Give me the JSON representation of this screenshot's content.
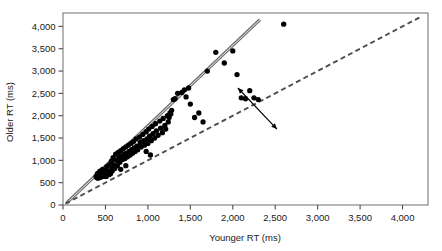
{
  "chart_data": {
    "type": "scatter",
    "title": "",
    "xlabel": "Younger RT (ms)",
    "ylabel": "Older RT (ms)",
    "xlim": [
      0,
      4300
    ],
    "ylim": [
      0,
      4300
    ],
    "grid": false,
    "legend": null,
    "xticks": [
      0,
      500,
      1000,
      1500,
      2000,
      2500,
      3000,
      3500,
      4000
    ],
    "xticklabels": [
      "0",
      "500",
      "1,000",
      "1,500",
      "2,000",
      "2,500",
      "3,000",
      "3,500",
      "4,000"
    ],
    "yticks": [
      0,
      500,
      1000,
      1500,
      2000,
      2500,
      3000,
      3500,
      4000
    ],
    "yticklabels": [
      "0",
      "500",
      "1,000",
      "1,500",
      "2,000",
      "2,500",
      "3,000",
      "3,500",
      "4,000"
    ],
    "marker": "filled-circle",
    "marker_color": "#000000",
    "marker_size": 4.6,
    "points": [
      [
        390,
        640
      ],
      [
        400,
        610
      ],
      [
        405,
        700
      ],
      [
        410,
        660
      ],
      [
        415,
        600
      ],
      [
        420,
        720
      ],
      [
        425,
        680
      ],
      [
        430,
        640
      ],
      [
        435,
        760
      ],
      [
        440,
        700
      ],
      [
        445,
        620
      ],
      [
        450,
        680
      ],
      [
        455,
        730
      ],
      [
        460,
        660
      ],
      [
        465,
        800
      ],
      [
        470,
        700
      ],
      [
        475,
        640
      ],
      [
        480,
        760
      ],
      [
        485,
        690
      ],
      [
        490,
        720
      ],
      [
        495,
        660
      ],
      [
        500,
        700
      ],
      [
        505,
        780
      ],
      [
        510,
        640
      ],
      [
        515,
        860
      ],
      [
        520,
        700
      ],
      [
        525,
        760
      ],
      [
        530,
        720
      ],
      [
        540,
        680
      ],
      [
        545,
        900
      ],
      [
        550,
        760
      ],
      [
        560,
        700
      ],
      [
        570,
        980
      ],
      [
        575,
        820
      ],
      [
        580,
        760
      ],
      [
        590,
        1060
      ],
      [
        600,
        900
      ],
      [
        610,
        820
      ],
      [
        620,
        1140
      ],
      [
        630,
        1000
      ],
      [
        640,
        880
      ],
      [
        650,
        1180
      ],
      [
        660,
        1060
      ],
      [
        670,
        960
      ],
      [
        680,
        1220
      ],
      [
        690,
        1100
      ],
      [
        700,
        1020
      ],
      [
        710,
        1260
      ],
      [
        720,
        1140
      ],
      [
        730,
        1040
      ],
      [
        740,
        1300
      ],
      [
        750,
        1160
      ],
      [
        760,
        1080
      ],
      [
        770,
        1340
      ],
      [
        780,
        1200
      ],
      [
        790,
        1120
      ],
      [
        800,
        1380
      ],
      [
        810,
        1240
      ],
      [
        820,
        1160
      ],
      [
        830,
        1420
      ],
      [
        840,
        1280
      ],
      [
        850,
        1200
      ],
      [
        860,
        1480
      ],
      [
        870,
        1320
      ],
      [
        880,
        1240
      ],
      [
        900,
        1520
      ],
      [
        910,
        1400
      ],
      [
        920,
        1300
      ],
      [
        940,
        1580
      ],
      [
        950,
        1440
      ],
      [
        960,
        1340
      ],
      [
        980,
        1640
      ],
      [
        990,
        1480
      ],
      [
        1000,
        1380
      ],
      [
        1010,
        1700
      ],
      [
        1020,
        1540
      ],
      [
        1040,
        1440
      ],
      [
        1050,
        1760
      ],
      [
        1060,
        1600
      ],
      [
        1080,
        1500
      ],
      [
        1090,
        1820
      ],
      [
        1100,
        1660
      ],
      [
        1120,
        1560
      ],
      [
        1140,
        1880
      ],
      [
        1150,
        1720
      ],
      [
        1170,
        1620
      ],
      [
        1180,
        1940
      ],
      [
        1200,
        1780
      ],
      [
        1210,
        1700
      ],
      [
        1230,
        2000
      ],
      [
        1240,
        1860
      ],
      [
        1250,
        1960
      ],
      [
        1260,
        2060
      ],
      [
        1270,
        2040
      ],
      [
        1280,
        2120
      ],
      [
        1300,
        2360
      ],
      [
        1320,
        2380
      ],
      [
        1350,
        2500
      ],
      [
        1400,
        2520
      ],
      [
        1430,
        2580
      ],
      [
        1450,
        2420
      ],
      [
        1480,
        2620
      ],
      [
        1500,
        2260
      ],
      [
        1550,
        1960
      ],
      [
        1600,
        2060
      ],
      [
        1650,
        1860
      ],
      [
        1700,
        3000
      ],
      [
        1800,
        3420
      ],
      [
        1900,
        3180
      ],
      [
        2000,
        3450
      ],
      [
        2050,
        2920
      ],
      [
        2100,
        2400
      ],
      [
        2150,
        2380
      ],
      [
        2200,
        2560
      ],
      [
        2250,
        2400
      ],
      [
        2300,
        2360
      ],
      [
        2600,
        4050
      ],
      [
        1030,
        1120
      ],
      [
        740,
        880
      ],
      [
        680,
        800
      ],
      [
        980,
        1200
      ]
    ],
    "lines": [
      {
        "name": "regression-line",
        "style": "solid-double",
        "color": "#6b6b6b",
        "x": [
          40,
          2320
        ],
        "y": [
          40,
          4150
        ]
      },
      {
        "name": "identity-line",
        "style": "dashed",
        "color": "#4d4d4d",
        "x": [
          30,
          4220
        ],
        "y": [
          30,
          4220
        ]
      }
    ],
    "annotations": [
      {
        "name": "gap-arrow",
        "type": "double-headed-arrow",
        "from": [
          2060,
          2620
        ],
        "to": [
          2520,
          1700
        ],
        "color": "#000000"
      }
    ]
  }
}
